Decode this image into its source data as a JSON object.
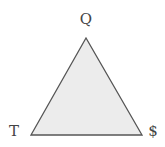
{
  "diagram": {
    "type": "triangle",
    "fill_color": "#ececec",
    "stroke_color": "#555555",
    "vertices": {
      "top": {
        "label": "Q",
        "x": 86,
        "y": 38
      },
      "bottom_left": {
        "label": "T",
        "x": 31,
        "y": 135
      },
      "bottom_right": {
        "label": "$",
        "x": 142,
        "y": 135
      }
    }
  }
}
